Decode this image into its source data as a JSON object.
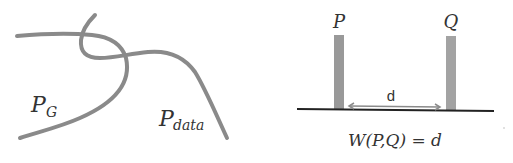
{
  "left_diagram": {
    "curve_a_label": "P",
    "curve_a_subscript": "G",
    "curve_b_label": "P",
    "curve_b_subscript": "data"
  },
  "right_diagram": {
    "bar_left_label": "P",
    "bar_right_label": "Q",
    "distance_label": "d",
    "formula": "W(P,Q) = d"
  },
  "colors": {
    "curve": "#8a8a8a",
    "bar": "#999999",
    "baseline": "#222222",
    "arrow": "#8a8a8a",
    "text": "#333333"
  }
}
